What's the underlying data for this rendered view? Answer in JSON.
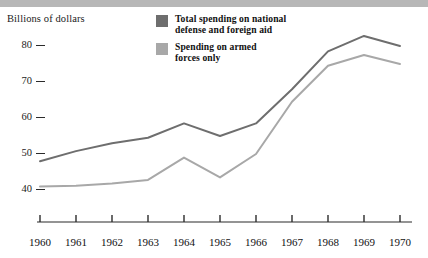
{
  "chart_data": {
    "type": "line",
    "title": "",
    "subtitle": "",
    "xlabel": "",
    "ylabel": "Billions of dollars",
    "x": [
      1960,
      1961,
      1962,
      1963,
      1964,
      1965,
      1966,
      1967,
      1968,
      1969,
      1970
    ],
    "xtick_labels": [
      "1960",
      "1961",
      "1962",
      "1963",
      "1964",
      "1965",
      "1966",
      "1967",
      "1968",
      "1969",
      "1970"
    ],
    "ytick_labels": [
      "40",
      "50",
      "60",
      "70",
      "80"
    ],
    "yticks": [
      40,
      50,
      60,
      70,
      80
    ],
    "ylim": [
      36,
      86
    ],
    "xlim": [
      1960,
      1970
    ],
    "grid": false,
    "legend_position": "top-center",
    "series": [
      {
        "name": "Total spending on national\ndefense and foreign aid",
        "color": "#6e6e6e",
        "values": [
          48.0,
          50.8,
          53.0,
          54.5,
          58.5,
          55.0,
          58.5,
          68.0,
          78.5,
          82.8,
          80.0
        ]
      },
      {
        "name": "Spending on armed\nforces only",
        "color": "#a8a8a8",
        "values": [
          41.0,
          41.2,
          41.8,
          42.8,
          49.0,
          43.5,
          50.0,
          64.5,
          74.5,
          77.5,
          75.0
        ]
      }
    ]
  },
  "legend": {
    "items": [
      {
        "label": "Total spending on national\ndefense and foreign aid",
        "swatch_color": "#6e6e6e"
      },
      {
        "label": "Spending on armed\nforces only",
        "swatch_color": "#a8a8a8"
      }
    ]
  },
  "axis": {
    "y_title": "Billions of dollars",
    "axis_color": "#2b2b2b"
  }
}
